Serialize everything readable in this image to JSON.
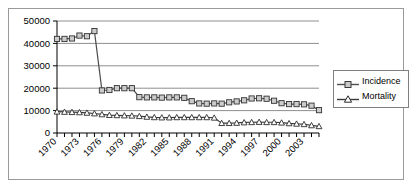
{
  "chart_data": {
    "type": "line",
    "title": "",
    "xlabel": "",
    "ylabel": "",
    "ylim": [
      0,
      50000
    ],
    "ytick_labels": [
      "0",
      "10000",
      "20000",
      "30000",
      "40000",
      "50000"
    ],
    "ytick_values": [
      0,
      10000,
      20000,
      30000,
      40000,
      50000
    ],
    "grid": "horizontal",
    "legend_position": "right",
    "xtick_label_rotation": -45,
    "xtick_label_step": 3,
    "xtick_labels": [
      "1970",
      "1973",
      "1976",
      "1979",
      "1982",
      "1985",
      "1988",
      "1991",
      "1994",
      "1997",
      "2000",
      "2003"
    ],
    "x": [
      1970,
      1971,
      1972,
      1973,
      1974,
      1975,
      1976,
      1977,
      1978,
      1979,
      1980,
      1981,
      1982,
      1983,
      1984,
      1985,
      1986,
      1987,
      1988,
      1989,
      1990,
      1991,
      1992,
      1993,
      1994,
      1995,
      1996,
      1997,
      1998,
      1999,
      2000,
      2001,
      2002,
      2003,
      2004,
      2005
    ],
    "series": [
      {
        "name": "Incidence",
        "marker": "square",
        "color": "#4d4d4d",
        "values": [
          42000,
          42000,
          42200,
          43500,
          43200,
          45500,
          19000,
          19200,
          20000,
          20000,
          20000,
          16000,
          15900,
          15900,
          15800,
          15900,
          15900,
          15700,
          14200,
          13200,
          13100,
          13200,
          13100,
          13700,
          14100,
          14600,
          15400,
          15500,
          15300,
          14400,
          13300,
          12900,
          12900,
          12800,
          12200,
          10200
        ]
      },
      {
        "name": "Mortality",
        "marker": "triangle",
        "color": "#3a3a3a",
        "values": [
          9500,
          9400,
          9300,
          9200,
          9000,
          8700,
          8300,
          8000,
          7900,
          7800,
          7700,
          7500,
          7200,
          7000,
          6900,
          6900,
          7000,
          7000,
          7000,
          7000,
          7000,
          6800,
          4400,
          4400,
          4500,
          4700,
          4800,
          4900,
          4800,
          4800,
          4600,
          4300,
          4100,
          3900,
          3400,
          3000
        ]
      }
    ]
  },
  "legend": {
    "items": [
      {
        "label": "Incidence"
      },
      {
        "label": "Mortality"
      }
    ]
  }
}
